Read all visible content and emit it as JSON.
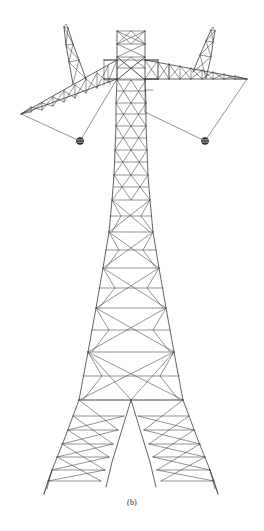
{
  "figure": {
    "caption": "(b)",
    "view": "front elevation",
    "background_color": "#ffffff",
    "line_color": "#3a3a3a",
    "canvas": {
      "width": 264,
      "height": 531
    }
  },
  "drawing": {
    "mast": {
      "axis_x": 131,
      "top_y": 31,
      "base_y": 497,
      "top_half_width": 14,
      "waist_half_width": 17,
      "base_half_width": 72,
      "panels": [
        {
          "y_top": 31,
          "y_bot": 57,
          "half_width_top": 14,
          "half_width_bot": 14,
          "pattern": "x-brace"
        },
        {
          "y_top": 57,
          "y_bot": 80,
          "half_width_top": 14,
          "half_width_bot": 14,
          "pattern": "x-brace"
        },
        {
          "y_top": 80,
          "y_bot": 103,
          "half_width_top": 14,
          "half_width_bot": 15,
          "pattern": "k-brace"
        },
        {
          "y_top": 103,
          "y_bot": 126,
          "half_width_top": 15,
          "half_width_bot": 16,
          "pattern": "k-brace"
        },
        {
          "y_top": 126,
          "y_bot": 150,
          "half_width_top": 16,
          "half_width_bot": 17,
          "pattern": "k-brace"
        },
        {
          "y_top": 150,
          "y_bot": 175,
          "half_width_top": 17,
          "half_width_bot": 19,
          "pattern": "k-brace"
        },
        {
          "y_top": 175,
          "y_bot": 200,
          "half_width_top": 19,
          "half_width_bot": 22,
          "pattern": "diamond"
        },
        {
          "y_top": 200,
          "y_bot": 232,
          "half_width_top": 22,
          "half_width_bot": 28,
          "pattern": "diamond"
        },
        {
          "y_top": 232,
          "y_bot": 268,
          "half_width_top": 28,
          "half_width_bot": 35,
          "pattern": "diamond"
        },
        {
          "y_top": 268,
          "y_bot": 308,
          "half_width_top": 35,
          "half_width_bot": 43,
          "pattern": "diamond"
        },
        {
          "y_top": 308,
          "y_bot": 352,
          "half_width_top": 43,
          "half_width_bot": 52,
          "pattern": "diamond"
        },
        {
          "y_top": 352,
          "y_bot": 400,
          "half_width_top": 52,
          "half_width_bot": 62,
          "pattern": "diamond"
        },
        {
          "y_top": 400,
          "y_bot": 497,
          "half_width_top": 62,
          "half_width_bot": 72,
          "pattern": "split-legs"
        }
      ]
    },
    "crossarm_left": {
      "root_x": 117,
      "root_y_top": 60,
      "root_y_bot": 79,
      "tip_x": 21,
      "tip_y": 114,
      "chord_top_from": [
        117,
        60
      ],
      "chord_top_to": [
        21,
        114
      ],
      "chord_bottom_from": [
        117,
        79
      ],
      "chord_bottom_to": [
        21,
        114
      ],
      "bays": 9
    },
    "crossarm_right": {
      "root_x": 145,
      "root_y_top": 60,
      "root_y_bot": 79,
      "tip_x": 247,
      "tip_y": 79,
      "chord_top_from": [
        145,
        60
      ],
      "chord_top_to": [
        247,
        79
      ],
      "chord_bottom_from": [
        145,
        79
      ],
      "chord_bottom_to": [
        247,
        79
      ],
      "bays": 10
    },
    "peak_left": {
      "base_x": 73,
      "base_y": 84,
      "apex_x": 64,
      "apex_y": 27,
      "width": 12
    },
    "peak_right": {
      "base_x": 206,
      "base_y": 78,
      "apex_x": 214,
      "apex_y": 31,
      "width": 12
    },
    "insulators": [
      {
        "id": "left-insulator",
        "x": 80,
        "y": 141,
        "radius": 3.6
      },
      {
        "id": "right-insulator",
        "x": 205,
        "y": 141,
        "radius": 3.6
      }
    ],
    "suspension_lines": [
      {
        "from": [
          21,
          114
        ],
        "to": [
          80,
          141
        ]
      },
      {
        "from": [
          117,
          79
        ],
        "to": [
          80,
          141
        ]
      },
      {
        "from": [
          247,
          79
        ],
        "to": [
          205,
          141
        ]
      },
      {
        "from": [
          145,
          112
        ],
        "to": [
          205,
          141
        ]
      }
    ]
  },
  "labels": {
    "caption_text": "(b)"
  }
}
